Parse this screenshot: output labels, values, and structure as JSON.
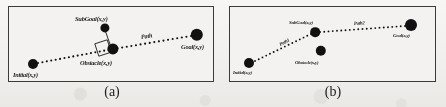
{
  "figure": {
    "width": 446,
    "height": 107,
    "background_color": "#f1efed",
    "border_color": "#3b3b3b",
    "marker_color": "#111111",
    "panel_background": "#f3f2f0"
  },
  "panels": [
    {
      "id": "panel-a",
      "caption": "(a)",
      "box": {
        "x": 8,
        "y": 6,
        "w": 206,
        "h": 76
      },
      "nodes": [
        {
          "name": "initial",
          "label": "Initial(x,y)",
          "cx": 24,
          "cy": 57,
          "r": 5.0,
          "label_x": 4,
          "label_y": 65
        },
        {
          "name": "subgoal",
          "label": "SubGoal(x,y)",
          "cx": 96,
          "cy": 21,
          "r": 4.6,
          "label_x": 66,
          "label_y": 9
        },
        {
          "name": "obstacle",
          "label": "Obstacle(x,y)",
          "cx": 104,
          "cy": 42,
          "r": 5.6,
          "label_x": 71,
          "label_y": 53
        },
        {
          "name": "goal",
          "label": "Goal(x,y)",
          "cx": 188,
          "cy": 28,
          "r": 6.2,
          "label_x": 172,
          "label_y": 37
        }
      ],
      "paths": [
        {
          "name": "path",
          "label": "Path",
          "style": "dotted",
          "points": [
            [
              29,
              56
            ],
            [
              104,
              42
            ],
            [
              182,
              29
            ]
          ],
          "label_x": 132,
          "label_y": 27,
          "label_rotate": -9
        }
      ],
      "links": [
        {
          "name": "subgoal-obstacle-link",
          "x1": 96,
          "y1": 23,
          "x2": 102,
          "y2": 40
        }
      ],
      "obstacle_square": {
        "cx": 94,
        "cy": 41,
        "size": 13,
        "rotate": -18
      }
    },
    {
      "id": "panel-b",
      "caption": "(b)",
      "box": {
        "x": 229,
        "y": 6,
        "w": 207,
        "h": 76
      },
      "nodes": [
        {
          "name": "initial",
          "label": "Initial(x,y)",
          "cx": 19,
          "cy": 56,
          "r": 5.0,
          "label_x": 3,
          "label_y": 64
        },
        {
          "name": "subgoal",
          "label": "SubGoal(x,y)",
          "cx": 85,
          "cy": 25,
          "r": 4.8,
          "label_x": 59,
          "label_y": 14
        },
        {
          "name": "obstacle",
          "label": "Obstacle(x,y)",
          "cx": 91,
          "cy": 44,
          "r": 5.2,
          "label_x": 65,
          "label_y": 54
        },
        {
          "name": "goal",
          "label": "Goal(x,y)",
          "cx": 181,
          "cy": 18,
          "r": 6.0,
          "label_x": 163,
          "label_y": 27
        }
      ],
      "paths": [
        {
          "name": "path1",
          "label": "Path1",
          "style": "dotted",
          "points": [
            [
              25,
              54
            ],
            [
              81,
              27
            ]
          ],
          "label_x": 50,
          "label_y": 36,
          "label_rotate": -27
        },
        {
          "name": "path2",
          "label": "Path2",
          "style": "dotted",
          "points": [
            [
              90,
              25
            ],
            [
              175,
              19
            ]
          ],
          "label_x": 124,
          "label_y": 15,
          "label_rotate": -4
        }
      ],
      "links": [],
      "obstacle_square": null
    }
  ],
  "captions": [
    {
      "name": "caption-a",
      "text": "(a)",
      "x": 84,
      "y": 84,
      "w": 56
    },
    {
      "name": "caption-b",
      "text": "(b)",
      "x": 305,
      "y": 84,
      "w": 56
    }
  ]
}
